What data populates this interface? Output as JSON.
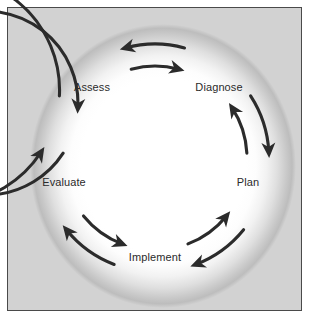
{
  "diagram": {
    "type": "cyclical-process",
    "shape": "ring",
    "background_color": "#d2d2d2",
    "frame_color": "#4a4a4a",
    "ring_color": "#ffffff",
    "arrow_color": "#2b2b2b",
    "label_color": "#2b2b2b",
    "center": {
      "x": 155,
      "y": 158
    },
    "label_radius": 108,
    "nodes": [
      {
        "id": "assess",
        "label": "Assess",
        "angle_deg": -126,
        "x": 92,
        "y": 87
      },
      {
        "id": "diagnose",
        "label": "Diagnose",
        "angle_deg": -54,
        "x": 219,
        "y": 87
      },
      {
        "id": "plan",
        "label": "Plan",
        "angle_deg": 18,
        "x": 248,
        "y": 182
      },
      {
        "id": "implement",
        "label": "Implement",
        "angle_deg": 90,
        "x": 155,
        "y": 257
      },
      {
        "id": "evaluate",
        "label": "Evaluate",
        "angle_deg": 162,
        "x": 64,
        "y": 182
      }
    ],
    "arrows": [
      {
        "id": "assess-to-diagnose",
        "from": "assess",
        "to": "diagnose",
        "track": "inner",
        "direction": "clockwise"
      },
      {
        "id": "diagnose-to-plan",
        "from": "diagnose",
        "to": "plan",
        "track": "outer",
        "direction": "clockwise"
      },
      {
        "id": "plan-to-implement",
        "from": "plan",
        "to": "implement",
        "track": "outer",
        "direction": "clockwise"
      },
      {
        "id": "implement-to-evaluate",
        "from": "implement",
        "to": "evaluate",
        "track": "outer",
        "direction": "clockwise"
      },
      {
        "id": "evaluate-to-assess",
        "from": "evaluate",
        "to": "assess",
        "track": "inner",
        "direction": "clockwise"
      },
      {
        "id": "diagnose-to-assess",
        "from": "diagnose",
        "to": "assess",
        "track": "outer",
        "direction": "counterclockwise"
      },
      {
        "id": "plan-to-diagnose",
        "from": "plan",
        "to": "diagnose",
        "track": "inner",
        "direction": "counterclockwise"
      },
      {
        "id": "implement-to-plan",
        "from": "implement",
        "to": "plan",
        "track": "inner",
        "direction": "counterclockwise"
      },
      {
        "id": "evaluate-to-implement",
        "from": "evaluate",
        "to": "implement",
        "track": "inner",
        "direction": "counterclockwise"
      },
      {
        "id": "assess-to-evaluate",
        "from": "assess",
        "to": "evaluate",
        "track": "outer",
        "direction": "counterclockwise"
      }
    ]
  }
}
